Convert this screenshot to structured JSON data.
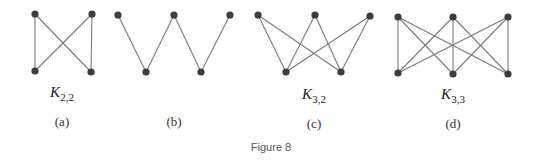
{
  "figure": {
    "caption": "Figure 8",
    "colors": {
      "edge": "#7a7a7a",
      "vertex": "#3c3c3c",
      "text": "#222222"
    },
    "graphs": [
      {
        "id": "a",
        "sublabel": "(a)",
        "name_main": "K",
        "name_sub": "2,2",
        "label_x": 62,
        "vertices": [
          [
            35,
            14
          ],
          [
            92,
            14
          ],
          [
            35,
            71
          ],
          [
            91,
            72
          ]
        ],
        "edges": [
          [
            0,
            2
          ],
          [
            0,
            3
          ],
          [
            1,
            2
          ],
          [
            1,
            3
          ]
        ]
      },
      {
        "id": "b",
        "sublabel": "(b)",
        "name_main": "",
        "name_sub": "",
        "label_x": 174,
        "vertices": [
          [
            118,
            15
          ],
          [
            174,
            15
          ],
          [
            230,
            15
          ],
          [
            146,
            72
          ],
          [
            201,
            72
          ]
        ],
        "edges": [
          [
            0,
            3
          ],
          [
            1,
            3
          ],
          [
            1,
            4
          ],
          [
            2,
            4
          ]
        ]
      },
      {
        "id": "c",
        "sublabel": "(c)",
        "name_main": "K",
        "name_sub": "3,2",
        "label_x": 314,
        "vertices": [
          [
            258,
            15
          ],
          [
            315,
            15
          ],
          [
            370,
            16
          ],
          [
            286,
            72
          ],
          [
            341,
            72
          ]
        ],
        "edges": [
          [
            0,
            3
          ],
          [
            0,
            4
          ],
          [
            1,
            3
          ],
          [
            1,
            4
          ],
          [
            2,
            3
          ],
          [
            2,
            4
          ]
        ]
      },
      {
        "id": "d",
        "sublabel": "(d)",
        "name_main": "K",
        "name_sub": "3,3",
        "label_x": 453,
        "vertices": [
          [
            398,
            17
          ],
          [
            453,
            17
          ],
          [
            508,
            17
          ],
          [
            398,
            73
          ],
          [
            453,
            74
          ],
          [
            508,
            74
          ]
        ],
        "edges": [
          [
            0,
            3
          ],
          [
            0,
            4
          ],
          [
            0,
            5
          ],
          [
            1,
            3
          ],
          [
            1,
            4
          ],
          [
            1,
            5
          ],
          [
            2,
            3
          ],
          [
            2,
            4
          ],
          [
            2,
            5
          ]
        ]
      }
    ]
  }
}
